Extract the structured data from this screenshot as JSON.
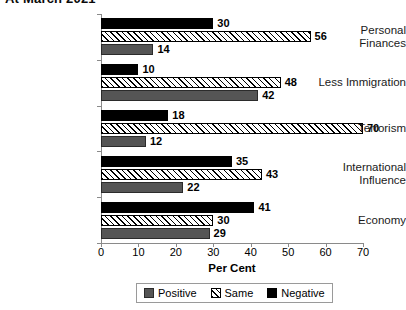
{
  "chart_data": {
    "type": "bar",
    "orientation": "horizontal",
    "title": "At March 2021",
    "xlabel": "Per Cent",
    "ylabel": "",
    "xlim": [
      0,
      70
    ],
    "xticks": [
      0,
      10,
      20,
      30,
      40,
      50,
      60,
      70
    ],
    "grid": false,
    "legend_position": "bottom",
    "categories": [
      "Personal\nFinances",
      "Less Immigration",
      "Terrorism",
      "International\nInfluence",
      "Economy"
    ],
    "series": [
      {
        "name": "Negative",
        "color": "#000000",
        "values": [
          30,
          10,
          18,
          35,
          41
        ]
      },
      {
        "name": "Same",
        "color": "#ffffff",
        "values": [
          56,
          48,
          70,
          43,
          30
        ]
      },
      {
        "name": "Positive",
        "color": "#555555",
        "values": [
          14,
          42,
          12,
          22,
          29
        ]
      }
    ]
  },
  "legend": {
    "items": [
      {
        "label": "Positive",
        "key": "positive"
      },
      {
        "label": "Same",
        "key": "same"
      },
      {
        "label": "Negative",
        "key": "negative"
      }
    ]
  }
}
